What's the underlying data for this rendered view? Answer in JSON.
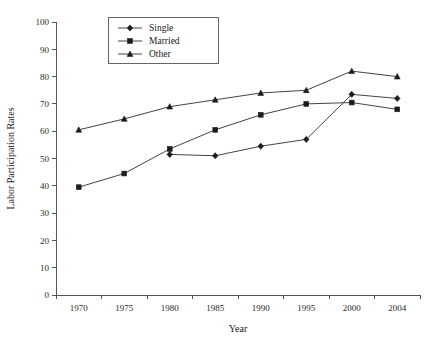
{
  "chart_data": {
    "type": "line",
    "title": "",
    "xlabel": "Year",
    "ylabel": "Labor Participation Rates",
    "categories": [
      "1970",
      "1975",
      "1980",
      "1985",
      "1990",
      "1995",
      "2000",
      "2004"
    ],
    "x": [
      1970,
      1975,
      1980,
      1985,
      1990,
      1995,
      2000,
      2004
    ],
    "xlim": [
      1970,
      2004
    ],
    "ylim": [
      0,
      100
    ],
    "ytick_labels": [
      "0",
      "10",
      "20",
      "30",
      "40",
      "50",
      "60",
      "70",
      "80",
      "90",
      "100"
    ],
    "yticks": [
      0,
      10,
      20,
      30,
      40,
      50,
      60,
      70,
      80,
      90,
      100
    ],
    "grid": false,
    "legend_position": "top-center",
    "series": [
      {
        "name": "Single",
        "marker": "diamond",
        "color": "#1c1c1c",
        "x": [
          1980,
          1985,
          1990,
          1995,
          2000,
          2004
        ],
        "values": [
          51.5,
          51.0,
          54.5,
          57.0,
          73.5,
          72.0
        ]
      },
      {
        "name": "Married",
        "marker": "square",
        "color": "#1c1c1c",
        "x": [
          1970,
          1975,
          1980,
          1985,
          1990,
          1995,
          2000,
          2004
        ],
        "values": [
          39.5,
          44.5,
          53.5,
          60.5,
          66.0,
          70.0,
          70.5,
          68.0
        ]
      },
      {
        "name": "Other",
        "marker": "triangle",
        "color": "#1c1c1c",
        "x": [
          1970,
          1975,
          1980,
          1985,
          1990,
          1995,
          2000,
          2004
        ],
        "values": [
          60.5,
          64.5,
          69.0,
          71.5,
          74.0,
          75.0,
          82.0,
          80.0
        ]
      }
    ]
  },
  "legend": {
    "entries": [
      {
        "label": "Single"
      },
      {
        "label": "Married"
      },
      {
        "label": "Other"
      }
    ]
  },
  "axes": {
    "x_title": "Year",
    "y_title": "Labor Participation Rates"
  }
}
